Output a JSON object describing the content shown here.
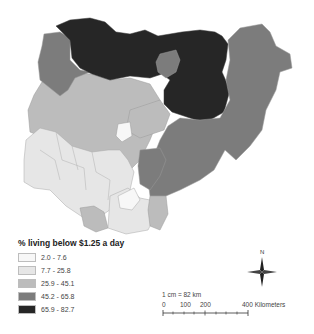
{
  "map": {
    "country": "Nigeria",
    "colors": {
      "class1": "#f7f7f7",
      "class2": "#e6e6e6",
      "class3": "#bcbcbc",
      "class4": "#7c7c7c",
      "class5": "#262626",
      "border": "#9a9a9a"
    }
  },
  "legend": {
    "title": "% living below $1.25 a day",
    "items": [
      {
        "label": "2.0 - 7.6",
        "color": "#f7f7f7"
      },
      {
        "label": "7.7 - 25.8",
        "color": "#e6e6e6"
      },
      {
        "label": "25.9 - 45.1",
        "color": "#bcbcbc"
      },
      {
        "label": "45.2 - 65.8",
        "color": "#7c7c7c"
      },
      {
        "label": "65.9 - 82.7",
        "color": "#262626"
      }
    ]
  },
  "scale": {
    "ratio": "1 cm = 82 km",
    "ticks": [
      "0",
      "100",
      "200",
      "400 Kilometers"
    ]
  },
  "compass": {
    "north_label": "N"
  }
}
